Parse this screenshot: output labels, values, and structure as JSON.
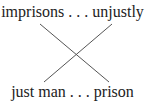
{
  "diagram": {
    "top_text": "imprisons . . . unjustly",
    "bottom_text": "just man . . . prison",
    "lines": [
      {
        "x1": 40,
        "y1": 24,
        "x2": 109,
        "y2": 82
      },
      {
        "x1": 112,
        "y1": 24,
        "x2": 44,
        "y2": 82
      }
    ],
    "line_color": "#555555"
  }
}
